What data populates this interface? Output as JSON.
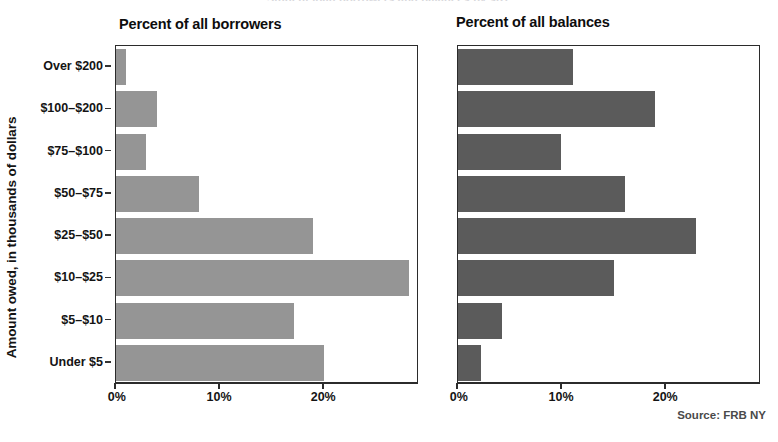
{
  "figure": {
    "clipped_header": "Student loan borrowers and balances by size",
    "y_axis_title": "Amount owed, in thousands of dollars",
    "source": "Source: FRB NY"
  },
  "chart_data": {
    "type": "bar",
    "orientation": "horizontal",
    "title": "",
    "xlabel": "",
    "ylabel": "Amount owed, in thousands of dollars",
    "categories": [
      "Over $200",
      "$100–$200",
      "$75–$100",
      "$50–$75",
      "$25–$50",
      "$10–$25",
      "$5–$10",
      "Under $5"
    ],
    "xlim": [
      0,
      29.1
    ],
    "xticks": [
      0,
      10,
      20
    ],
    "xticklabels": [
      "0%",
      "10%",
      "20%"
    ],
    "grid": false,
    "legend": false,
    "panels": [
      {
        "title": "Percent of all borrowers",
        "color": "#959595",
        "values": [
          1.0,
          3.9,
          2.9,
          8.0,
          18.9,
          28.1,
          17.1,
          20.0
        ]
      },
      {
        "title": "Percent of all balances",
        "color": "#5b5b5b",
        "values": [
          11.0,
          18.9,
          9.9,
          16.0,
          22.9,
          15.0,
          4.2,
          2.2
        ]
      }
    ]
  }
}
